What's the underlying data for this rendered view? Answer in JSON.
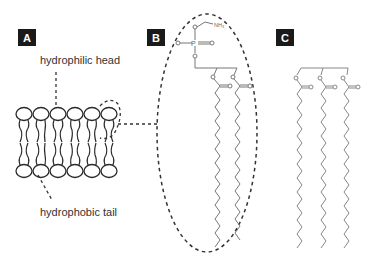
{
  "panels": {
    "a": {
      "label": "A"
    },
    "b": {
      "label": "B"
    },
    "c": {
      "label": "C"
    }
  },
  "annotations": {
    "head": "hydrophilic head",
    "tail": "hydrophobic tail"
  },
  "molecule_b": {
    "amine_label": "NH₃",
    "phosphorus_label": "P",
    "oxygen_label": "O"
  },
  "colors": {
    "label_bg": "#1a1a1a",
    "line": "#333333",
    "chain": "#888888",
    "dash": "#444444"
  }
}
